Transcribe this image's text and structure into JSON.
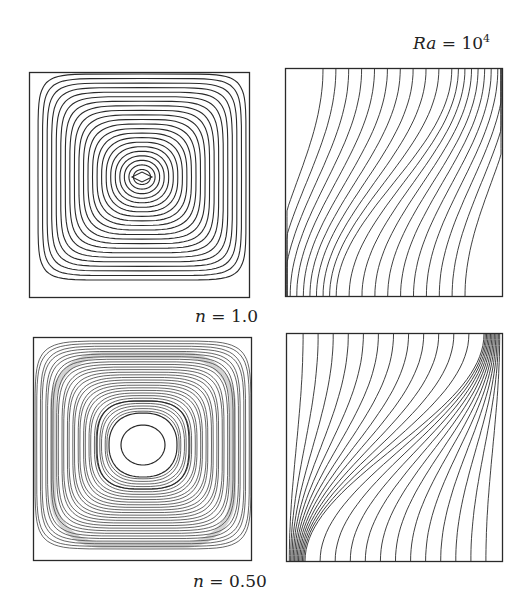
{
  "figure": {
    "header_label": {
      "var": "Ra",
      "eq": " = 10",
      "exp": "4"
    },
    "rows": [
      {
        "label": {
          "var": "n",
          "eq": " = 1.0"
        },
        "left_panel": "streamlines",
        "right_panel": "isotherms"
      },
      {
        "label": {
          "var": "n",
          "eq": " = 0.50"
        },
        "left_panel": "streamlines",
        "right_panel": "isotherms"
      }
    ]
  },
  "colors": {
    "line": "#2a2a2a",
    "background": "#ffffff"
  }
}
